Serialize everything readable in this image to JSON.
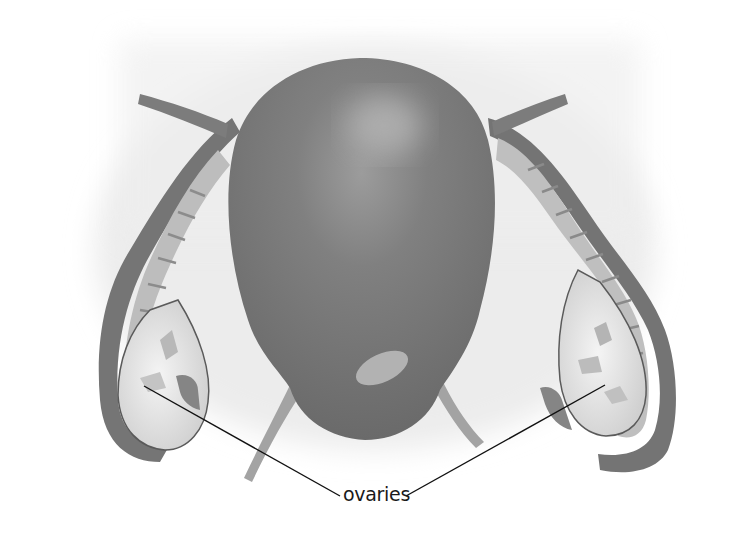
{
  "diagram": {
    "style": "grayscale illustration",
    "labels": [
      {
        "text": "ovaries",
        "x": 343,
        "y": 490,
        "points_to": [
          "left ovary",
          "right ovary"
        ]
      }
    ],
    "colors": {
      "background": "#ffffff",
      "backdrop_wash": "#e6e6e6",
      "tissue_dark": "#6e6e6e",
      "tissue_mid": "#8a8a8a",
      "ovary_fill": "#e2e2e2",
      "leader_line": "#111111"
    }
  }
}
